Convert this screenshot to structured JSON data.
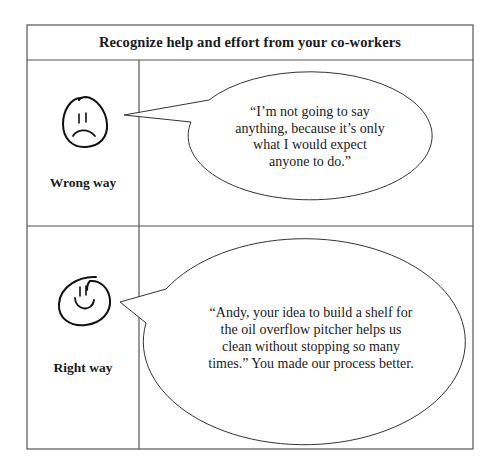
{
  "title": "Recognize help and effort from your co-workers",
  "colors": {
    "border": "#555555",
    "ink": "#1a1a1a",
    "bubble_stroke": "#333333",
    "background": "#ffffff"
  },
  "rows": [
    {
      "label": "Wrong way",
      "face_icon": "sad-face-icon",
      "quote_lines": [
        "“I’m not going to say",
        "anything, because it’s only",
        "what I would expect",
        "anyone to do.”"
      ]
    },
    {
      "label": "Right way",
      "face_icon": "happy-face-icon",
      "quote_lines": [
        "“Andy, your idea to build a shelf for",
        "the oil overflow pitcher helps us",
        "clean without stopping so many",
        "times.” You made our process better."
      ]
    }
  ]
}
